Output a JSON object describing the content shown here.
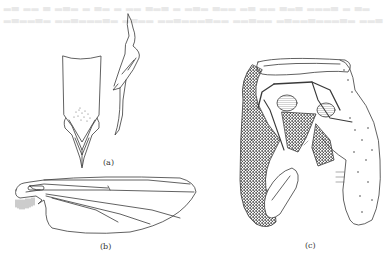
{
  "figure": {
    "background": "#ffffff",
    "ink_color": "#3a3a3a",
    "bleed_through_text": {
      "visible": true,
      "legible": false,
      "lines": 2
    },
    "panels": [
      {
        "id": "a",
        "label": "(a)",
        "subject": "hypopygium and appendage (lateral/ventral views)"
      },
      {
        "id": "b",
        "label": "(b)",
        "subject": "wing"
      },
      {
        "id": "c",
        "label": "(c)",
        "subject": "male genitalia"
      }
    ]
  }
}
